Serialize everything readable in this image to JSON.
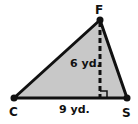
{
  "figure": {
    "type": "triangle",
    "fill_color": "#c8c8c8",
    "stroke_color": "#111111",
    "vertices": {
      "F": {
        "label": "F",
        "x": 100,
        "y": 20
      },
      "C": {
        "label": "C",
        "x": 14,
        "y": 98
      },
      "S": {
        "label": "S",
        "x": 127,
        "y": 98
      }
    },
    "height": {
      "label": "6 yd.",
      "foot_x": 100,
      "foot_y": 98
    },
    "base": {
      "label": "9 yd."
    }
  }
}
